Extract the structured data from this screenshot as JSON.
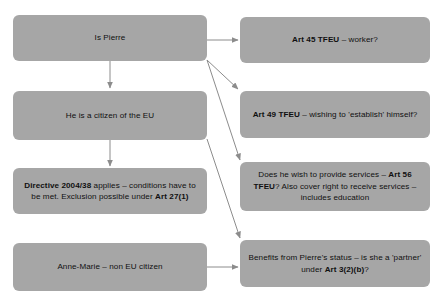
{
  "diagram": {
    "background_color": "#ffffff",
    "node_fill_color": "#a6a6a6",
    "node_text_color": "#101010",
    "connector_color": "#8c8c8c"
  },
  "nodes": {
    "is_pierre": {
      "label": "Is Pierre",
      "plain": "Is Pierre"
    },
    "citizen_eu": {
      "label": "He is a citizen of the EU",
      "plain": "He is a citizen of the EU"
    },
    "directive": {
      "segments": [
        {
          "text": "Directive 2004/38",
          "bold": true
        },
        {
          "text": " applies – conditions have to be met. Exclusion possible under ",
          "bold": false
        },
        {
          "text": "Art 27(1)",
          "bold": true
        }
      ],
      "plain": "Directive 2004/38 applies – conditions have to be met. Exclusion possible under Art 27(1)"
    },
    "anne_marie": {
      "label": "Anne-Marie – non EU citizen",
      "plain": "Anne-Marie – non EU citizen"
    },
    "art45": {
      "segments": [
        {
          "text": "Art 45 TFEU",
          "bold": true
        },
        {
          "text": " – worker?",
          "bold": false
        }
      ],
      "plain": "Art 45 TFEU – worker?"
    },
    "art49": {
      "segments": [
        {
          "text": "Art 49 TFEU",
          "bold": true
        },
        {
          "text": " – wishing to 'establish' himself?",
          "bold": false
        }
      ],
      "plain": "Art 49 TFEU – wishing to 'establish' himself?"
    },
    "art56": {
      "segments": [
        {
          "text": "Does he wish to provide services – ",
          "bold": false
        },
        {
          "text": "Art 56 TFEU",
          "bold": true
        },
        {
          "text": "? Also cover right to receive services – includes education",
          "bold": false
        }
      ],
      "plain": "Does he wish to provide services – Art 56 TFEU? Also cover right to receive services – includes education"
    },
    "benefits": {
      "segments": [
        {
          "text": "Benefits from Pierre's status – is she a 'partner' under ",
          "bold": false
        },
        {
          "text": "Art 3(2)(b)",
          "bold": true
        },
        {
          "text": "?",
          "bold": false
        }
      ],
      "plain": "Benefits from Pierre's status – is she a 'partner' under Art 3(2)(b)?"
    }
  },
  "edges": [
    {
      "name": "edge-is-pierre-to-citizen-eu",
      "from": "is_pierre",
      "to": "citizen_eu"
    },
    {
      "name": "edge-citizen-eu-to-directive",
      "from": "citizen_eu",
      "to": "directive"
    },
    {
      "name": "edge-is-pierre-to-art45",
      "from": "is_pierre",
      "to": "art45"
    },
    {
      "name": "edge-is-pierre-to-art49",
      "from": "is_pierre",
      "to": "art49"
    },
    {
      "name": "edge-is-pierre-to-art56",
      "from": "is_pierre",
      "to": "art56"
    },
    {
      "name": "edge-citizen-eu-to-benefits",
      "from": "citizen_eu",
      "to": "benefits"
    },
    {
      "name": "edge-anne-marie-to-benefits",
      "from": "anne_marie",
      "to": "benefits"
    }
  ]
}
